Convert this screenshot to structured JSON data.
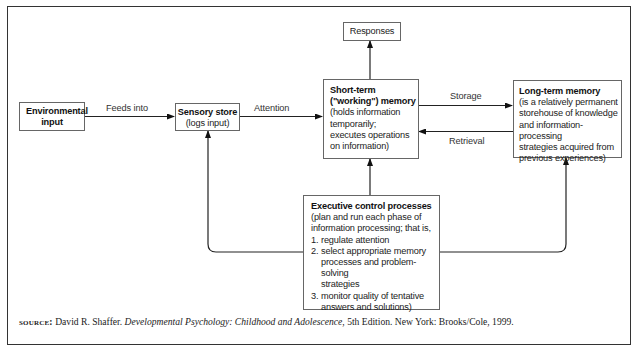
{
  "diagram": {
    "nodes": {
      "environmental_input": {
        "title": "Environmental input"
      },
      "sensory_store": {
        "title": "Sensory store",
        "desc": "(logs input)"
      },
      "responses": {
        "title": "Responses"
      },
      "short_term": {
        "title_line1": "Short-term",
        "title_line2": "(\"working\") memory",
        "desc": [
          "(holds information",
          "temporarily;",
          "executes operations",
          "on information)"
        ]
      },
      "long_term": {
        "title": "Long-term memory",
        "desc": [
          "(is a relatively permanent",
          "storehouse of knowledge",
          "and information-processing",
          "strategies acquired from",
          "previous experiences)"
        ]
      },
      "executive": {
        "title": "Executive control processes",
        "desc": [
          "(plan and run each phase of",
          "information processing; that is,"
        ],
        "items": [
          {
            "num": "1.",
            "lines": [
              "regulate attention"
            ]
          },
          {
            "num": "2.",
            "lines": [
              "select appropriate memory",
              "processes and problem-solving",
              "strategies"
            ]
          },
          {
            "num": "3.",
            "lines": [
              "monitor quality of tentative",
              "answers and solutions)"
            ]
          }
        ]
      }
    },
    "edges": {
      "feeds_into": "Feeds into",
      "attention": "Attention",
      "storage": "Storage",
      "retrieval": "Retrieval"
    }
  },
  "source": {
    "label": "source:",
    "author": "David R. Shaffer.",
    "title": "Developmental Psychology: Childhood and Adolescence",
    "rest": ", 5th Edition. New York: Brooks/Cole, 1999."
  }
}
